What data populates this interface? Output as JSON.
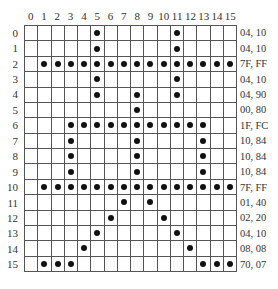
{
  "columns": [
    "0",
    "1",
    "2",
    "3",
    "4",
    "5",
    "6",
    "7",
    "8",
    "9",
    "10",
    "11",
    "12",
    "13",
    "14",
    "15"
  ],
  "rows": [
    {
      "label": "0",
      "hex": "04, 10",
      "bits": "0000010000010000"
    },
    {
      "label": "1",
      "hex": "04, 10",
      "bits": "0000010000010000"
    },
    {
      "label": "2",
      "hex": "7F, FF",
      "bits": "0111111111111111"
    },
    {
      "label": "3",
      "hex": "04, 10",
      "bits": "0000010000010000"
    },
    {
      "label": "4",
      "hex": "04, 90",
      "bits": "0000010010010000"
    },
    {
      "label": "5",
      "hex": "00, 80",
      "bits": "0000000010000000"
    },
    {
      "label": "6",
      "hex": "1F, FC",
      "bits": "0001111111111100"
    },
    {
      "label": "7",
      "hex": "10, 84",
      "bits": "0001000010000100"
    },
    {
      "label": "8",
      "hex": "10, 84",
      "bits": "0001000010000100"
    },
    {
      "label": "9",
      "hex": "10, 84",
      "bits": "0001000010000100"
    },
    {
      "label": "10",
      "hex": "7F, FF",
      "bits": "0111111111111111"
    },
    {
      "label": "11",
      "hex": "01, 40",
      "bits": "0000000101000000"
    },
    {
      "label": "12",
      "hex": "02, 20",
      "bits": "0000001000100000"
    },
    {
      "label": "13",
      "hex": "04, 10",
      "bits": "0000010000010000"
    },
    {
      "label": "14",
      "hex": "08, 08",
      "bits": "0000100000001000"
    },
    {
      "label": "15",
      "hex": "70, 07",
      "bits": "0111000000000111"
    }
  ],
  "style": {
    "dot_color": "#111111",
    "grid_color": "#555555"
  }
}
